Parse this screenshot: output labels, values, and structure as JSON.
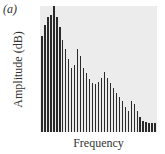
{
  "panel": {
    "label": "(a)"
  },
  "chart_data": {
    "type": "bar",
    "title": "",
    "xlabel": "Frequency",
    "ylabel": "Amplitude (dB)",
    "grid": false,
    "legend": null,
    "ylim": [
      0,
      100
    ],
    "categories": [
      "1",
      "2",
      "3",
      "4",
      "5",
      "6",
      "7",
      "8",
      "9",
      "10",
      "11",
      "12",
      "13",
      "14",
      "15",
      "16",
      "17",
      "18",
      "19",
      "20",
      "21",
      "22",
      "23",
      "24",
      "25",
      "26",
      "27",
      "28",
      "29",
      "30",
      "31",
      "32",
      "33",
      "34",
      "35",
      "36",
      "37",
      "38",
      "39"
    ],
    "values": [
      76,
      85,
      91,
      93,
      100,
      91,
      83,
      73,
      66,
      58,
      51,
      53,
      66,
      60,
      51,
      47,
      42,
      39,
      38,
      40,
      43,
      48,
      43,
      39,
      35,
      31,
      28,
      25,
      20,
      17,
      25,
      22,
      17,
      12,
      9,
      8,
      7,
      7,
      7
    ]
  },
  "colors": {
    "bar": "#2a2a2a",
    "plot_background": "#ececec"
  }
}
